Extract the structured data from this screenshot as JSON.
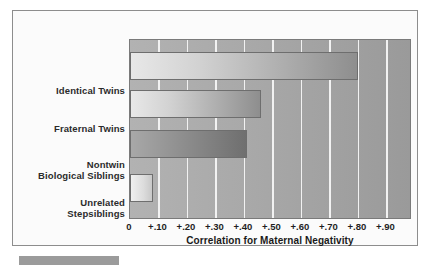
{
  "chart_data": {
    "type": "bar",
    "orientation": "horizontal",
    "title": "",
    "xlabel": "Correlation for Maternal Negativity",
    "ylabel": "",
    "categories": [
      "Identical Twins",
      "Fraternal Twins",
      "Nontwin Biological Siblings",
      "Unrelated Stepsiblings"
    ],
    "values": [
      0.8,
      0.46,
      0.41,
      0.08
    ],
    "xlim": [
      0,
      0.99
    ],
    "xticks": [
      0,
      0.1,
      0.2,
      0.3,
      0.4,
      0.5,
      0.6,
      0.7,
      0.8,
      0.9
    ],
    "xticklabels": [
      "0",
      "+.10",
      "+.20",
      "+.30",
      "+.40",
      "+.50",
      "+.60",
      "+.70",
      "+.80",
      "+.90"
    ],
    "grid": true,
    "legend": false,
    "bars": [
      {
        "label": "Identical Twins",
        "label_line1": "Identical Twins",
        "label_line2": "",
        "value": 0.8
      },
      {
        "label": "Fraternal Twins",
        "label_line1": "Fraternal Twins",
        "label_line2": "",
        "value": 0.46
      },
      {
        "label": "Nontwin Biological Siblings",
        "label_line1": "Nontwin",
        "label_line2": "Biological Siblings",
        "value": 0.41
      },
      {
        "label": "Unrelated Stepsiblings",
        "label_line1": "Unrelated",
        "label_line2": "Stepsiblings",
        "value": 0.08
      }
    ]
  },
  "colors": {
    "frame_border": "#8d8d8d",
    "plot_background": "#a8a8a8",
    "gridline": "#f2f2f2",
    "bar_fill_light": "#e8e8e8",
    "bar_fill_dark": "#8e8e8e",
    "text": "#1f1f1f"
  }
}
